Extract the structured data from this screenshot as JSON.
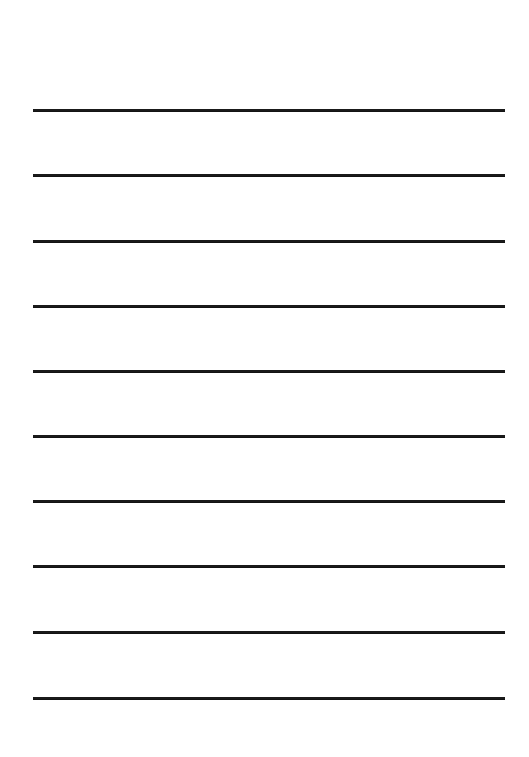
{
  "page": {
    "background": "#ffffff",
    "line_color": "#1a1a1a",
    "line_count": 10,
    "line_positions_y": [
      109,
      174,
      240,
      305,
      370,
      435,
      500,
      565,
      631,
      697
    ],
    "line_x_start": 33,
    "line_x_end": 505
  }
}
